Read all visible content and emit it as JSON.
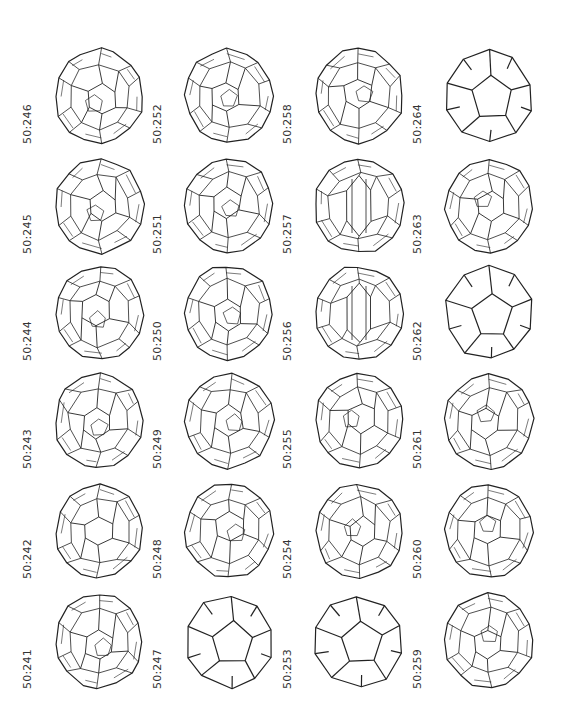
{
  "figure": {
    "columns": 4,
    "rows": 6,
    "cells": [
      {
        "label": "50:246",
        "col": 0,
        "row": 0,
        "style": "dense"
      },
      {
        "label": "50:252",
        "col": 1,
        "row": 0,
        "style": "dense"
      },
      {
        "label": "50:258",
        "col": 2,
        "row": 0,
        "style": "dense"
      },
      {
        "label": "50:264",
        "col": 3,
        "row": 0,
        "style": "simple"
      },
      {
        "label": "50:245",
        "col": 0,
        "row": 1,
        "style": "dense"
      },
      {
        "label": "50:251",
        "col": 1,
        "row": 1,
        "style": "dense"
      },
      {
        "label": "50:257",
        "col": 2,
        "row": 1,
        "style": "barrel"
      },
      {
        "label": "50:263",
        "col": 3,
        "row": 1,
        "style": "dense"
      },
      {
        "label": "50:244",
        "col": 0,
        "row": 2,
        "style": "dense"
      },
      {
        "label": "50:250",
        "col": 1,
        "row": 2,
        "style": "dense"
      },
      {
        "label": "50:256",
        "col": 2,
        "row": 2,
        "style": "barrel"
      },
      {
        "label": "50:262",
        "col": 3,
        "row": 2,
        "style": "simple"
      },
      {
        "label": "50:243",
        "col": 0,
        "row": 3,
        "style": "dense"
      },
      {
        "label": "50:249",
        "col": 1,
        "row": 3,
        "style": "dense"
      },
      {
        "label": "50:255",
        "col": 2,
        "row": 3,
        "style": "dense"
      },
      {
        "label": "50:261",
        "col": 3,
        "row": 3,
        "style": "dense"
      },
      {
        "label": "50:242",
        "col": 0,
        "row": 4,
        "style": "symmetric"
      },
      {
        "label": "50:248",
        "col": 1,
        "row": 4,
        "style": "dense"
      },
      {
        "label": "50:254",
        "col": 2,
        "row": 4,
        "style": "dense"
      },
      {
        "label": "50:260",
        "col": 3,
        "row": 4,
        "style": "dense"
      },
      {
        "label": "50:241",
        "col": 0,
        "row": 5,
        "style": "dense"
      },
      {
        "label": "50:247",
        "col": 1,
        "row": 5,
        "style": "simple"
      },
      {
        "label": "50:253",
        "col": 2,
        "row": 5,
        "style": "simple"
      },
      {
        "label": "50:259",
        "col": 3,
        "row": 5,
        "style": "dense"
      }
    ],
    "colors": {
      "line": "#222222",
      "label": "#333333",
      "background": "#ffffff"
    }
  }
}
